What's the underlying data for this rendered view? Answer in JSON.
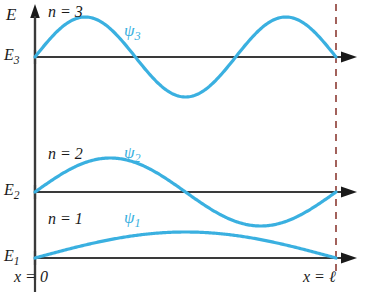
{
  "figure": {
    "axis_label_energy": "E",
    "x_origin_label": "x = 0",
    "x_end_label": "x = ℓ",
    "colors": {
      "wave": "#3ab0e0",
      "axis": "#3a3a3a",
      "boundary_dashed": "#8c3b33",
      "text": "#1a1a1a"
    }
  },
  "levels": [
    {
      "id": "n3",
      "energy_label": "E",
      "energy_sub": "3",
      "quantum_number_label": "n = 3",
      "wave_label": "ψ",
      "wave_sub": "3",
      "n": 3,
      "baseline_y": 57,
      "amplitude": 40
    },
    {
      "id": "n2",
      "energy_label": "E",
      "energy_sub": "2",
      "quantum_number_label": "n = 2",
      "wave_label": "ψ",
      "wave_sub": "2",
      "n": 2,
      "baseline_y": 192,
      "amplitude": 34
    },
    {
      "id": "n1",
      "energy_label": "E",
      "energy_sub": "1",
      "quantum_number_label": "n = 1",
      "wave_label": "ψ",
      "wave_sub": "1",
      "n": 1,
      "baseline_y": 258,
      "amplitude": 26
    }
  ],
  "chart_data": {
    "type": "line",
    "xlabel": "x",
    "ylabel": "E",
    "x_axis": {
      "origin_label": "x = 0",
      "end_label": "x = ℓ",
      "origin_px": 35,
      "end_px": 336
    },
    "grid": false,
    "legend": false,
    "series": [
      {
        "name": "ψ₃",
        "n": 3,
        "baseline": "E₃",
        "formula": "sin(3πx/ℓ)",
        "nodes_interior": 2,
        "half_wavelengths": 3,
        "color": "#3ab0e0"
      },
      {
        "name": "ψ₂",
        "n": 2,
        "baseline": "E₂",
        "formula": "sin(2πx/ℓ)",
        "nodes_interior": 1,
        "half_wavelengths": 2,
        "color": "#3ab0e0"
      },
      {
        "name": "ψ₁",
        "n": 1,
        "baseline": "E₁",
        "formula": "sin(πx/ℓ)",
        "nodes_interior": 0,
        "half_wavelengths": 1,
        "color": "#3ab0e0"
      }
    ],
    "energy_levels": [
      {
        "label": "E₃",
        "n": 3
      },
      {
        "label": "E₂",
        "n": 2
      },
      {
        "label": "E₁",
        "n": 1
      }
    ]
  }
}
